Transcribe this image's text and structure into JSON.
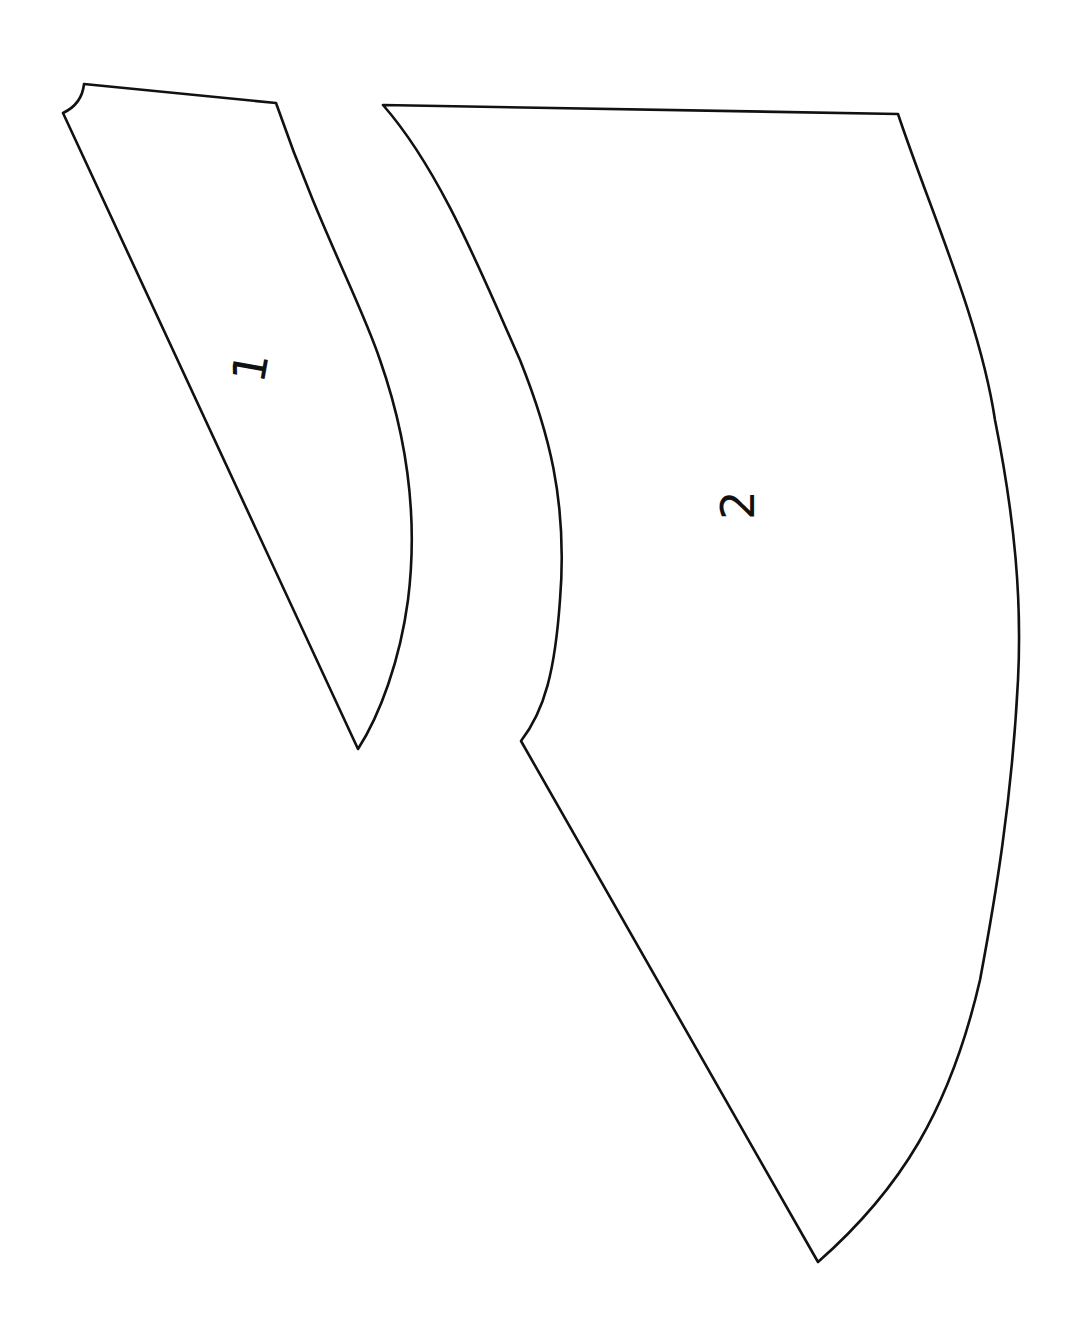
{
  "diagram": {
    "kind": "sewing-pattern-pieces",
    "stroke_color": "#111111",
    "background": "#ffffff",
    "pieces": [
      {
        "id": 1,
        "label": "1",
        "label_rotation_deg": -80
      },
      {
        "id": 2,
        "label": "2",
        "label_rotation_deg": -90
      }
    ]
  }
}
